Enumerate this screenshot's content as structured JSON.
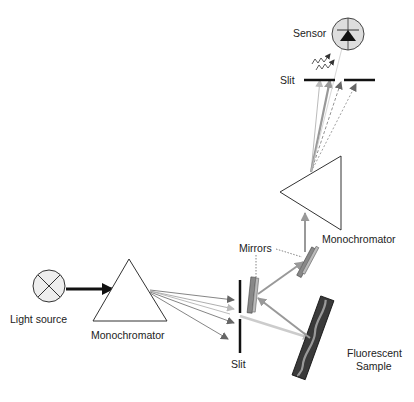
{
  "diagram": {
    "labels": {
      "sensor": "Sensor",
      "slit_top": "Slit",
      "monochromator_right": "Monochromator",
      "mirrors": "Mirrors",
      "light_source": "Light source",
      "monochromator_left": "Monochromator",
      "slit_bottom": "Slit",
      "sample_line1": "Fluorescent",
      "sample_line2": "Sample"
    },
    "colors": {
      "stroke": "#222222",
      "beam_dark": "#666666",
      "beam_light": "#bbbbbb",
      "sensor_fill": "#dddddd",
      "mirror_fill": "#888888",
      "sample_fill": "#444444"
    },
    "components": [
      {
        "id": "light-source",
        "type": "lamp"
      },
      {
        "id": "monochromator-1",
        "type": "prism"
      },
      {
        "id": "slit-1",
        "type": "slit"
      },
      {
        "id": "mirror-1",
        "type": "mirror"
      },
      {
        "id": "fluorescent-sample",
        "type": "sample"
      },
      {
        "id": "mirror-2",
        "type": "mirror"
      },
      {
        "id": "monochromator-2",
        "type": "prism"
      },
      {
        "id": "slit-2",
        "type": "slit"
      },
      {
        "id": "sensor",
        "type": "photodiode"
      }
    ]
  }
}
